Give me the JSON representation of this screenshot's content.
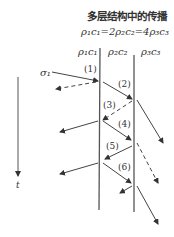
{
  "title": "多层结构中的传播",
  "relation": "ρ₁c₁=2ρ₂c₂=4ρ₃c₃",
  "layers": [
    "ρ₁c₁",
    "ρ₂c₂",
    "ρ₃c₃"
  ],
  "incident_label": "σ₁",
  "time_label": "t",
  "wave_labels": [
    "(1)",
    "(2)",
    "(3)",
    "(4)",
    "(5)",
    "(6)"
  ]
}
